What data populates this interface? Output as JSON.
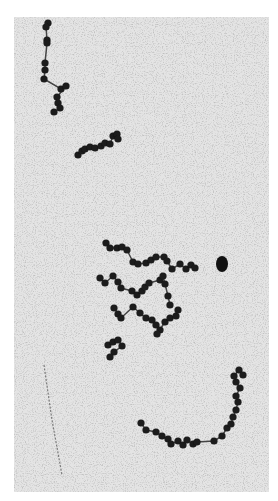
{
  "image": {
    "background": "#e4e4e4",
    "noise_color": "#8a8a8a",
    "bead_color": "#1a1a1a",
    "frame": {
      "x": 14,
      "y": 17,
      "w": 255,
      "h": 475
    }
  },
  "features": {
    "filament": {
      "points": [
        [
          44,
          365
        ],
        [
          52,
          420
        ],
        [
          62,
          475
        ]
      ],
      "color": "#7a7a7a"
    },
    "blob": {
      "cx": 222,
      "cy": 264,
      "rx": 6,
      "ry": 8,
      "color": "#111111"
    },
    "chains": [
      {
        "name": "top-chain",
        "beads": [
          [
            48,
            23
          ],
          [
            46,
            27
          ],
          [
            47,
            40
          ],
          [
            47,
            43
          ],
          [
            45,
            63
          ],
          [
            45,
            70
          ],
          [
            44,
            79
          ],
          [
            61,
            89
          ],
          [
            66,
            86
          ],
          [
            57,
            97
          ],
          [
            58,
            103
          ],
          [
            60,
            108
          ],
          [
            54,
            112
          ]
        ]
      },
      {
        "name": "upper-mid-chain",
        "beads": [
          [
            78,
            155
          ],
          [
            82,
            151
          ],
          [
            85,
            149
          ],
          [
            90,
            147
          ],
          [
            95,
            148
          ],
          [
            101,
            146
          ],
          [
            105,
            143
          ],
          [
            110,
            144
          ],
          [
            113,
            136
          ],
          [
            117,
            134
          ],
          [
            118,
            139
          ]
        ]
      },
      {
        "name": "center-cluster-a",
        "beads": [
          [
            106,
            243
          ],
          [
            110,
            248
          ],
          [
            117,
            248
          ],
          [
            122,
            247
          ],
          [
            127,
            250
          ],
          [
            133,
            262
          ],
          [
            138,
            264
          ],
          [
            146,
            263
          ],
          [
            151,
            260
          ],
          [
            156,
            257
          ],
          [
            164,
            257
          ],
          [
            167,
            261
          ],
          [
            172,
            269
          ],
          [
            180,
            264
          ],
          [
            186,
            269
          ],
          [
            191,
            265
          ],
          [
            195,
            268
          ]
        ]
      },
      {
        "name": "center-cluster-b",
        "beads": [
          [
            100,
            278
          ],
          [
            105,
            283
          ],
          [
            113,
            276
          ],
          [
            118,
            282
          ],
          [
            121,
            288
          ],
          [
            132,
            291
          ],
          [
            137,
            295
          ],
          [
            142,
            291
          ],
          [
            145,
            287
          ],
          [
            149,
            283
          ],
          [
            160,
            280
          ],
          [
            163,
            276
          ],
          [
            165,
            284
          ],
          [
            168,
            296
          ],
          [
            170,
            305
          ]
        ]
      },
      {
        "name": "center-cluster-c",
        "beads": [
          [
            114,
            308
          ],
          [
            118,
            314
          ],
          [
            121,
            318
          ],
          [
            133,
            307
          ],
          [
            140,
            313
          ],
          [
            146,
            318
          ],
          [
            152,
            320
          ],
          [
            156,
            325
          ],
          [
            160,
            330
          ],
          [
            157,
            334
          ],
          [
            165,
            322
          ],
          [
            170,
            318
          ],
          [
            176,
            316
          ],
          [
            178,
            310
          ]
        ]
      },
      {
        "name": "center-cluster-d",
        "beads": [
          [
            108,
            345
          ],
          [
            113,
            342
          ],
          [
            118,
            340
          ],
          [
            122,
            346
          ],
          [
            114,
            352
          ],
          [
            110,
            357
          ]
        ]
      },
      {
        "name": "bottom-chain",
        "beads": [
          [
            141,
            423
          ],
          [
            146,
            430
          ],
          [
            156,
            432
          ],
          [
            162,
            436
          ],
          [
            168,
            439
          ],
          [
            171,
            444
          ],
          [
            178,
            441
          ],
          [
            183,
            445
          ],
          [
            187,
            440
          ],
          [
            193,
            444
          ],
          [
            197,
            442
          ],
          [
            214,
            441
          ],
          [
            222,
            436
          ],
          [
            227,
            428
          ],
          [
            231,
            424
          ],
          [
            233,
            417
          ],
          [
            236,
            410
          ],
          [
            238,
            402
          ],
          [
            236,
            396
          ],
          [
            240,
            388
          ],
          [
            236,
            382
          ],
          [
            234,
            376
          ],
          [
            239,
            370
          ],
          [
            243,
            375
          ]
        ]
      }
    ]
  }
}
